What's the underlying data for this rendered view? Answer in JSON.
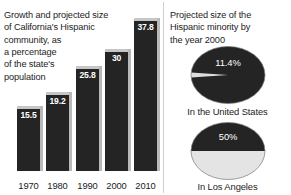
{
  "figure": {
    "background": "#ffffff",
    "bar_color": "#242424",
    "bar_highlight_color": "#b9b9b9",
    "pie_dark_color": "#242424",
    "pie_light_color": "#e0e0e0",
    "text_color": "#1c1c1c"
  },
  "left_panel": {
    "caption_lines": [
      "Growth and projected size",
      "of California's Hispanic",
      "community, as",
      "a percentage",
      "of the state's",
      "population"
    ]
  },
  "right_panel": {
    "heading_lines": [
      "Projected size of the",
      "Hispanic minority by",
      "the year 2000"
    ],
    "pies": [
      {
        "label": "In the United States",
        "value_label": "11.4%"
      },
      {
        "label": "In Los Angeles",
        "value_label": "50%"
      }
    ]
  },
  "chart_data": [
    {
      "type": "bar",
      "title": "Growth and projected size of California's Hispanic community, as a percentage of the state's population",
      "categories": [
        "1970",
        "1980",
        "1990",
        "2000",
        "2010"
      ],
      "values": [
        15.5,
        19.2,
        25.8,
        30,
        37.8
      ],
      "value_labels": [
        "15.5",
        "19.2",
        "25.8",
        "30",
        "37.8"
      ],
      "xlabel": "",
      "ylabel": "Percentage of state's population",
      "ylim": [
        0,
        37.8
      ],
      "grid": false,
      "legend": "none"
    },
    {
      "type": "pie",
      "title": "Projected size of the Hispanic minority by the year 2000",
      "subtitle": "In the United States",
      "labels": [
        "Hispanic",
        "Other"
      ],
      "values": [
        11.4,
        88.6
      ],
      "value_labels": [
        "11.4%",
        ""
      ],
      "legend": "none"
    },
    {
      "type": "pie",
      "title": "Projected size of the Hispanic minority by the year 2000",
      "subtitle": "In Los Angeles",
      "labels": [
        "Hispanic",
        "Other"
      ],
      "values": [
        50,
        50
      ],
      "value_labels": [
        "50%",
        ""
      ],
      "legend": "none"
    }
  ]
}
